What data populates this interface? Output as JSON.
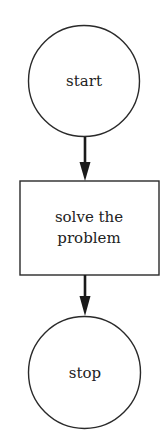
{
  "diagram": {
    "type": "flowchart",
    "colors": {
      "stroke": "#2a2a2a",
      "background": "#ffffff",
      "text": "#222222"
    },
    "nodes": [
      {
        "id": "start",
        "shape": "circle",
        "label": "start"
      },
      {
        "id": "process",
        "shape": "rectangle",
        "label_lines": [
          "solve the",
          "problem"
        ]
      },
      {
        "id": "stop",
        "shape": "circle",
        "label": "stop"
      }
    ],
    "edges": [
      {
        "from": "start",
        "to": "process"
      },
      {
        "from": "process",
        "to": "stop"
      }
    ]
  }
}
